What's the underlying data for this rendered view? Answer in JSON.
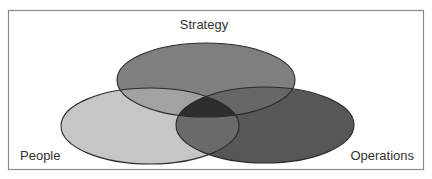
{
  "diagram": {
    "type": "venn",
    "frame": {
      "x": 8,
      "y": 10,
      "width": 416,
      "height": 160,
      "stroke": "#8a8a8a"
    },
    "sets": [
      {
        "id": "strategy",
        "label": "Strategy",
        "cx": 206,
        "cy": 80,
        "rx": 89,
        "ry": 37,
        "fill": "#7f7f7f",
        "label_x": 204,
        "label_y": 29,
        "anchor": "middle"
      },
      {
        "id": "people",
        "label": "People",
        "cx": 150,
        "cy": 126,
        "rx": 89,
        "ry": 38,
        "fill": "#c6c6c6",
        "label_x": 20,
        "label_y": 160,
        "anchor": "start"
      },
      {
        "id": "operations",
        "label": "Operations",
        "cx": 265,
        "cy": 125,
        "rx": 89,
        "ry": 38,
        "fill": "#575757",
        "label_x": 414,
        "label_y": 160,
        "anchor": "end"
      }
    ],
    "overlap_colors": {
      "strategy_people": "#a2a2a2",
      "strategy_operations": "#666666",
      "people_operations": "#6a6a6a",
      "center": "#2e2e2e"
    },
    "stroke": "#2a2a2a"
  }
}
